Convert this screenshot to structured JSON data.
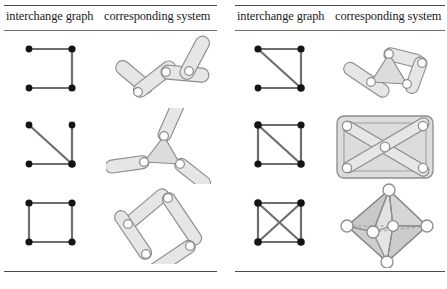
{
  "figure": {
    "panel_count": 2,
    "colors": {
      "rule": "#4d4d4d",
      "node": "#141414",
      "graph_edge": "#6e6e6e",
      "bar_fill": "#e3e3e3",
      "bar_stroke": "#8c8c8c",
      "plate_fill": "#dcdcdc",
      "plate_stroke": "#8c8c8c",
      "joint_fill": "#ffffff",
      "joint_stroke": "#8c8c8c",
      "hidden_edge": "#9a9a9a"
    }
  },
  "panels": [
    {
      "id": "left",
      "columns": [
        {
          "label": "interchange graph"
        },
        {
          "label": "corresponding system"
        }
      ],
      "rows": [
        {
          "graph": {
            "name": "path-four-vertices",
            "vertices": 4,
            "edges": 3,
            "description": "open square path: top-left to top-right to bottom-right to bottom-left"
          },
          "system": {
            "name": "open-chain-four-bars",
            "bars": 4,
            "joints": 3,
            "description": "zigzag open chain of four bars joined end to end"
          }
        },
        {
          "graph": {
            "name": "star-three-edges",
            "vertices": 4,
            "edges": 3,
            "description": "three edges meeting at the bottom-right vertex"
          },
          "system": {
            "name": "triangle-plate-three-arms",
            "bars": 3,
            "joints": 3,
            "plates": 1,
            "description": "central triangular plate with three radiating bars"
          }
        },
        {
          "graph": {
            "name": "four-cycle",
            "vertices": 4,
            "edges": 4,
            "description": "closed square cycle, all four sides"
          },
          "system": {
            "name": "four-bar-closed-loop",
            "bars": 4,
            "joints": 4,
            "description": "closed quadrilateral linkage of four bars"
          }
        }
      ]
    },
    {
      "id": "right",
      "columns": [
        {
          "label": "interchange graph"
        },
        {
          "label": "corresponding system"
        }
      ],
      "rows": [
        {
          "graph": {
            "name": "triangle-with-pendant-edge",
            "vertices": 4,
            "edges": 4,
            "description": "triangle on three vertices plus a pendant edge to bottom-left"
          },
          "system": {
            "name": "triangle-plate-with-arm-and-loop",
            "bars": 3,
            "joints": 4,
            "plates": 1,
            "description": "triangular plate with a pendant bar at left and a two-bar loop at right"
          }
        },
        {
          "graph": {
            "name": "four-cycle-with-one-diagonal",
            "vertices": 4,
            "edges": 5,
            "description": "square with one diagonal from top-left to bottom-right"
          },
          "system": {
            "name": "rectangular-plate-with-diagonals",
            "bars": 4,
            "joints": 5,
            "plates": 1,
            "description": "solid rectangular plate braced by both diagonals with a central joint"
          }
        },
        {
          "graph": {
            "name": "complete-graph-k4",
            "vertices": 4,
            "edges": 6,
            "description": "square with both diagonals, complete graph on four vertices"
          },
          "system": {
            "name": "octahedral-framework",
            "bars": 12,
            "joints": 6,
            "description": "three-dimensional octahedron with shaded faces and dashed hidden edges"
          }
        }
      ]
    }
  ]
}
